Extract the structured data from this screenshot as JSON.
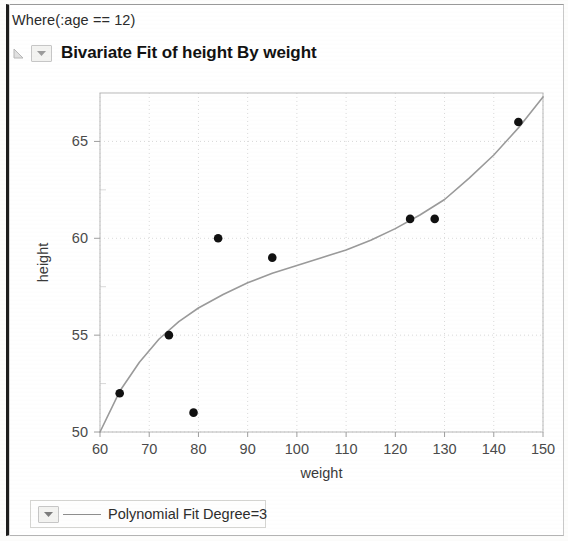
{
  "window": {
    "where_clause": "Where(:age == 12)",
    "title": "Bivariate Fit of height By weight",
    "disclosure_icon": "triangle-disclosure-icon",
    "popup_icon": "red-triangle-popup-icon"
  },
  "legend": {
    "popup_icon": "red-triangle-popup-icon",
    "label": "Polynomial Fit Degree=3",
    "line_color": "#8d8d8d"
  },
  "colors": {
    "point": "#111111",
    "fit_line": "#9a9a9a",
    "grid": "#d9d9d9",
    "frame": "#b9b9b9",
    "text": "#2d2d2d"
  },
  "chart_data": {
    "type": "scatter",
    "title": "Bivariate Fit of height By weight",
    "xlabel": "weight",
    "ylabel": "height",
    "xlim": [
      60,
      150
    ],
    "ylim": [
      50,
      67.5
    ],
    "xticks": [
      60,
      70,
      80,
      90,
      100,
      110,
      120,
      130,
      140,
      150
    ],
    "yticks": [
      50,
      55,
      60,
      65
    ],
    "xtick_labels": [
      "60",
      "70",
      "80",
      "90",
      "100",
      "110",
      "120",
      "130",
      "140",
      "150"
    ],
    "ytick_labels": [
      "50",
      "55",
      "60",
      "65"
    ],
    "grid": true,
    "legend_position": "below-plot",
    "series": [
      {
        "name": "height By weight",
        "type": "scatter",
        "marker": "filled-circle",
        "color": "#111111",
        "points": [
          {
            "x": 64,
            "y": 52
          },
          {
            "x": 74,
            "y": 55
          },
          {
            "x": 79,
            "y": 51
          },
          {
            "x": 84,
            "y": 60
          },
          {
            "x": 95,
            "y": 59
          },
          {
            "x": 123,
            "y": 61
          },
          {
            "x": 128,
            "y": 61
          },
          {
            "x": 145,
            "y": 66
          }
        ]
      },
      {
        "name": "Polynomial Fit Degree=3",
        "type": "line",
        "color": "#9a9a9a",
        "points": [
          {
            "x": 60,
            "y": 50.0
          },
          {
            "x": 64,
            "y": 52.1
          },
          {
            "x": 68,
            "y": 53.6
          },
          {
            "x": 72,
            "y": 54.8
          },
          {
            "x": 76,
            "y": 55.7
          },
          {
            "x": 80,
            "y": 56.4
          },
          {
            "x": 85,
            "y": 57.1
          },
          {
            "x": 90,
            "y": 57.7
          },
          {
            "x": 95,
            "y": 58.2
          },
          {
            "x": 100,
            "y": 58.6
          },
          {
            "x": 105,
            "y": 59.0
          },
          {
            "x": 110,
            "y": 59.4
          },
          {
            "x": 115,
            "y": 59.9
          },
          {
            "x": 120,
            "y": 60.5
          },
          {
            "x": 125,
            "y": 61.2
          },
          {
            "x": 130,
            "y": 62.0
          },
          {
            "x": 135,
            "y": 63.1
          },
          {
            "x": 140,
            "y": 64.3
          },
          {
            "x": 145,
            "y": 65.7
          },
          {
            "x": 150,
            "y": 67.3
          }
        ]
      }
    ]
  }
}
